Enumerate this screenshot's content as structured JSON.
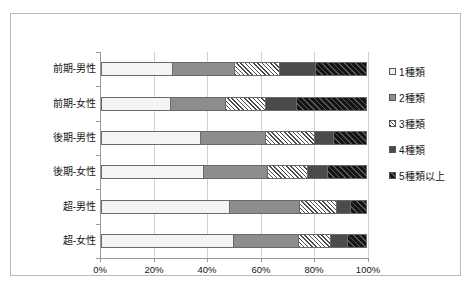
{
  "chart_title": "",
  "axis": {
    "x_ticks": [
      "0%",
      "20%",
      "40%",
      "60%",
      "80%",
      "100%"
    ],
    "x_min": 0,
    "x_max": 100
  },
  "legend": {
    "items": [
      {
        "label": "1種類",
        "key": "empty-square-key"
      },
      {
        "label": "2種類",
        "key": "gray-square-key"
      },
      {
        "label": "3種類",
        "key": "hatched-square-key"
      },
      {
        "label": "4種類",
        "key": "dark-gray-square-key"
      },
      {
        "label": "5種類以上",
        "key": "black-square-key"
      }
    ]
  },
  "chart_data": {
    "type": "bar",
    "orientation": "horizontal",
    "stacked": true,
    "normalized_percent": true,
    "title": "",
    "xlabel": "",
    "ylabel": "",
    "xlim": [
      0,
      100
    ],
    "grid": true,
    "legend_position": "right",
    "categories": [
      "前期-男性",
      "前期-女性",
      "後期-男性",
      "後期-女性",
      "超-男性",
      "超-女性"
    ],
    "tick_labels": [
      "0%",
      "20%",
      "40%",
      "60%",
      "80%",
      "100%"
    ],
    "series": [
      {
        "name": "1種類",
        "values": [
          26.9,
          26.2,
          37.6,
          38.8,
          48.5,
          50.0
        ]
      },
      {
        "name": "2種類",
        "values": [
          23.5,
          20.8,
          24.6,
          24.1,
          26.4,
          24.4
        ]
      },
      {
        "name": "3種類",
        "values": [
          16.8,
          15.2,
          18.4,
          14.8,
          14.0,
          12.0
        ]
      },
      {
        "name": "4種類",
        "values": [
          13.6,
          11.4,
          7.1,
          7.7,
          5.0,
          6.3
        ]
      },
      {
        "name": "5種類以上",
        "values": [
          19.2,
          26.4,
          12.3,
          14.6,
          6.1,
          7.3
        ]
      }
    ],
    "cumulative_boundaries": [
      [
        26.9,
        50.4,
        67.2,
        80.8,
        100.0
      ],
      [
        26.2,
        47.0,
        62.2,
        73.6,
        100.0
      ],
      [
        37.6,
        62.2,
        80.6,
        87.7,
        100.0
      ],
      [
        38.8,
        62.9,
        77.7,
        85.4,
        100.0
      ],
      [
        48.5,
        74.9,
        88.9,
        93.9,
        100.0
      ],
      [
        50.0,
        74.4,
        86.4,
        92.7,
        100.0
      ]
    ]
  }
}
